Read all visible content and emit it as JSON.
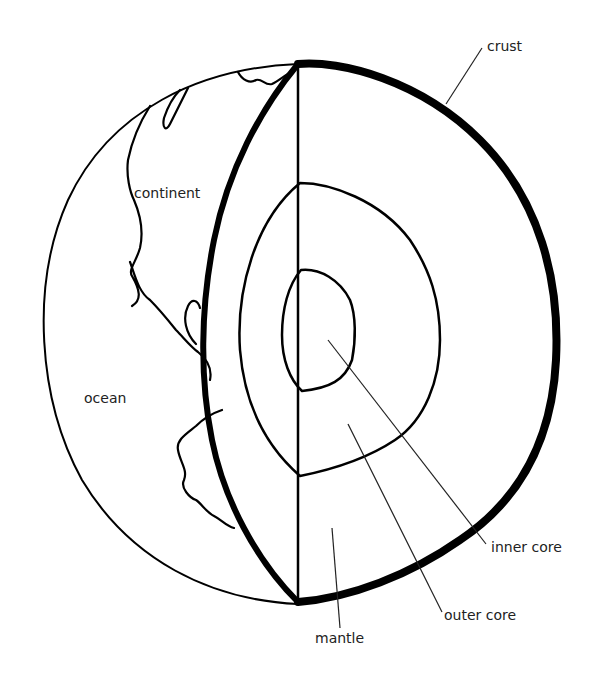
{
  "diagram": {
    "labels": {
      "crust": "crust",
      "continent": "continent",
      "ocean": "ocean",
      "inner_core": "inner core",
      "outer_core": "outer core",
      "mantle": "mantle"
    },
    "colors": {
      "line": "#000000",
      "text": "#222222",
      "background": "#ffffff"
    }
  }
}
